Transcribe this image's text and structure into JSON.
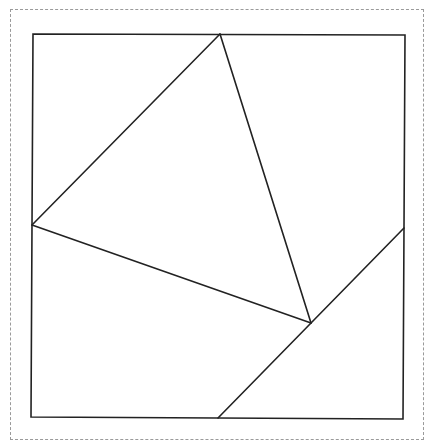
{
  "diagram": {
    "stroke_color": "#222222",
    "frame_color": "#9a9a9a",
    "points": {
      "square_tl": [
        33,
        34
      ],
      "square_tr": [
        405,
        35
      ],
      "square_br": [
        403,
        419
      ],
      "square_bl": [
        31,
        417
      ],
      "apex_top": [
        220,
        34
      ],
      "left_mid": [
        32,
        225
      ],
      "inner": [
        311,
        323
      ],
      "right_mid": [
        404,
        228
      ],
      "bottom_mid": [
        218,
        418
      ]
    },
    "segments": [
      {
        "name": "triangle-edge-left",
        "from": "left_mid",
        "to": "apex_top"
      },
      {
        "name": "triangle-edge-right",
        "from": "apex_top",
        "to": "inner"
      },
      {
        "name": "triangle-edge-bottom",
        "from": "left_mid",
        "to": "inner"
      },
      {
        "name": "cut-line-lower-right",
        "from": "bottom_mid",
        "to": "right_mid"
      }
    ]
  }
}
